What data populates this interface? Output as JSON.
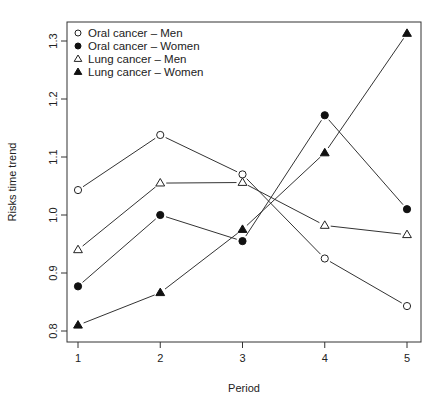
{
  "chart_data": {
    "type": "line",
    "title": "",
    "xlabel": "Period",
    "ylabel": "Risks time trend",
    "x": [
      1,
      2,
      3,
      4,
      5
    ],
    "xticks": [
      "1",
      "2",
      "3",
      "4",
      "5"
    ],
    "yticks": [
      "0.8",
      "0.9",
      "1.0",
      "1.1",
      "1.2",
      "1.3"
    ],
    "ylim": [
      0.78,
      1.33
    ],
    "grid": false,
    "legend_position": "top-left",
    "series": [
      {
        "name": "Oral cancer – Men",
        "marker": "open-circle",
        "values": [
          1.043,
          1.138,
          1.07,
          0.925,
          0.843
        ]
      },
      {
        "name": "Oral cancer – Women",
        "marker": "filled-circle",
        "values": [
          0.877,
          1.0,
          0.955,
          1.172,
          1.01
        ]
      },
      {
        "name": "Lung cancer – Men",
        "marker": "open-triangle",
        "values": [
          0.94,
          1.055,
          1.056,
          0.982,
          0.966
        ]
      },
      {
        "name": "Lung cancer – Women",
        "marker": "filled-triangle",
        "values": [
          0.81,
          0.866,
          0.975,
          1.107,
          1.313
        ]
      }
    ]
  }
}
